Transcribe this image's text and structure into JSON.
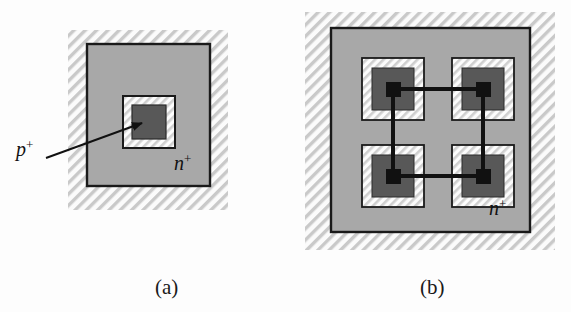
{
  "figure": {
    "type": "semiconductor-layout-diagram",
    "background_color": "#fdfdfd",
    "panels": [
      {
        "id": "a",
        "caption": "(a)",
        "caption_x": 155,
        "caption_y": 294,
        "description": "single square p+ contact cell inside n+ region",
        "hatch_region": {
          "x": 68,
          "y": 30,
          "w": 160,
          "h": 180
        },
        "nwell_square": {
          "x": 87,
          "y": 44,
          "w": 123,
          "h": 142
        },
        "cell": {
          "outer": {
            "x": 123,
            "y": 96,
            "w": 52,
            "h": 52
          },
          "inner": {
            "x": 132,
            "y": 105,
            "w": 34,
            "h": 34
          }
        },
        "labels": [
          {
            "name": "p-plus-label",
            "base": "p",
            "sup": "+",
            "x": 16,
            "y": 156
          },
          {
            "name": "n-plus-label",
            "base": "n",
            "sup": "+",
            "x": 174,
            "y": 170
          }
        ],
        "leader_line": {
          "x1": 46,
          "y1": 158,
          "x2": 142,
          "y2": 123
        }
      },
      {
        "id": "b",
        "caption": "(b)",
        "caption_x": 420,
        "caption_y": 294,
        "description": "two-by-two array of p+ contact cells linked by metal interconnect inside n+ region",
        "hatch_region": {
          "x": 305,
          "y": 12,
          "w": 250,
          "h": 238
        },
        "nwell_square": {
          "x": 331,
          "y": 28,
          "w": 199,
          "h": 204
        },
        "cells": [
          {
            "name": "cell-top-left",
            "outer": {
              "x": 362,
              "y": 58,
              "w": 62,
              "h": 62
            },
            "mid": {
              "x": 372,
              "y": 68,
              "w": 42,
              "h": 42
            },
            "contact": {
              "x": 386,
              "y": 82,
              "w": 15,
              "h": 15
            }
          },
          {
            "name": "cell-top-right",
            "outer": {
              "x": 452,
              "y": 58,
              "w": 62,
              "h": 62
            },
            "mid": {
              "x": 462,
              "y": 68,
              "w": 42,
              "h": 42
            },
            "contact": {
              "x": 476,
              "y": 82,
              "w": 15,
              "h": 15
            }
          },
          {
            "name": "cell-bottom-left",
            "outer": {
              "x": 362,
              "y": 145,
              "w": 62,
              "h": 62
            },
            "mid": {
              "x": 372,
              "y": 155,
              "w": 42,
              "h": 42
            },
            "contact": {
              "x": 386,
              "y": 169,
              "w": 15,
              "h": 15
            }
          },
          {
            "name": "cell-bottom-right",
            "outer": {
              "x": 452,
              "y": 145,
              "w": 62,
              "h": 62
            },
            "mid": {
              "x": 462,
              "y": 155,
              "w": 42,
              "h": 42
            },
            "contact": {
              "x": 476,
              "y": 169,
              "w": 15,
              "h": 15
            }
          }
        ],
        "interconnect": {
          "name": "metal-ring",
          "stroke_width": 4,
          "segments": [
            {
              "name": "metal-top",
              "x1": 393,
              "y1": 89,
              "x2": 483,
              "y2": 89
            },
            {
              "name": "metal-bottom",
              "x1": 393,
              "y1": 176,
              "x2": 483,
              "y2": 176
            },
            {
              "name": "metal-left",
              "x1": 393,
              "y1": 89,
              "x2": 393,
              "y2": 176
            },
            {
              "name": "metal-right",
              "x1": 483,
              "y1": 89,
              "x2": 483,
              "y2": 176
            }
          ]
        },
        "labels": [
          {
            "name": "n-plus-label",
            "base": "n",
            "sup": "+",
            "x": 489,
            "y": 215
          }
        ]
      }
    ],
    "colors": {
      "nwell_fill": "#a8a8a8",
      "cell_mid_fill": "#585858",
      "contact_fill": "#111111",
      "hatch_line": "#c9c9c9",
      "hatch_background": "#fbfbfb",
      "outline": "#1a1a1a",
      "leader": "#111111",
      "text": "#111111"
    }
  }
}
